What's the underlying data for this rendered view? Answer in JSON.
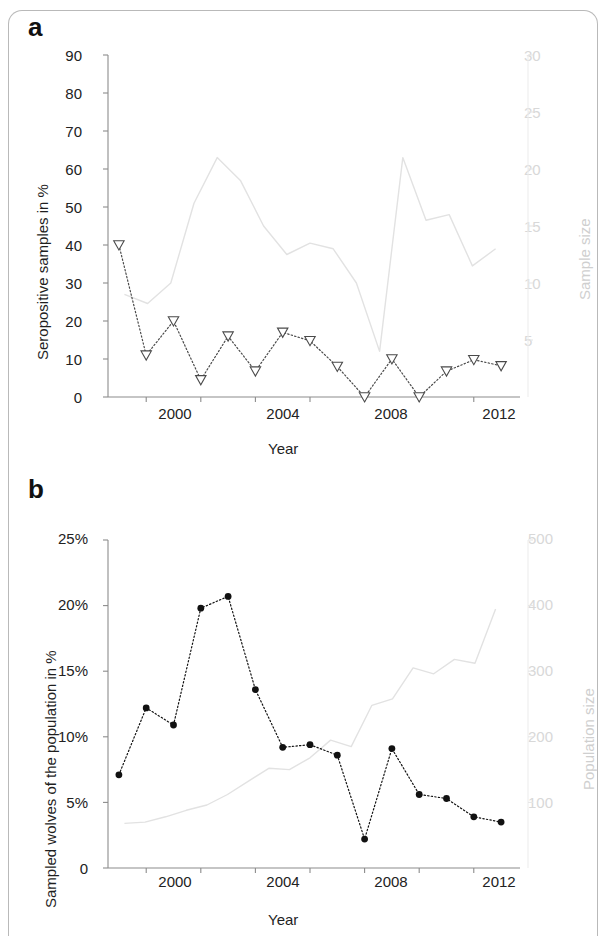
{
  "figure": {
    "panel_a_letter": "a",
    "panel_b_letter": "b"
  },
  "panel_a": {
    "ylabel_left": "Seropositive samples in %",
    "ylabel_right": "Sample size",
    "xlabel": "Year",
    "y_left_ticks": [
      "0",
      "10",
      "20",
      "30",
      "40",
      "50",
      "60",
      "70",
      "80",
      "90"
    ],
    "y_right_ticks": [
      "5",
      "10",
      "15",
      "20",
      "25",
      "30"
    ],
    "x_ticks": [
      "2000",
      "2004",
      "2008",
      "2012"
    ]
  },
  "panel_b": {
    "ylabel_left": "Sampled wolves of the population in %",
    "ylabel_right": "Population size",
    "xlabel": "Year",
    "y_left_ticks": [
      "0",
      "5%",
      "10%",
      "15%",
      "20%",
      "25%"
    ],
    "y_right_ticks": [
      "100",
      "200",
      "300",
      "400",
      "500"
    ],
    "x_ticks": [
      "2000",
      "2004",
      "2008",
      "2012"
    ]
  },
  "chart_data": [
    {
      "type": "line",
      "id": "panel-a",
      "title": "a",
      "xlabel": "Year",
      "ylabel": "Seropositive samples in %",
      "y2label": "Sample size",
      "xlim": [
        1998.6,
        2013.4
      ],
      "ylim": [
        0,
        90
      ],
      "y2lim": [
        0,
        30
      ],
      "grid": false,
      "legend": "none",
      "x": [
        1999,
        2000,
        2001,
        2002,
        2003,
        2004,
        2005,
        2006,
        2007,
        2008,
        2009,
        2010,
        2011,
        2012,
        2013
      ],
      "series": [
        {
          "name": "Seropositive samples in %",
          "axis": "left",
          "marker": "open-triangle-down",
          "linestyle": "dotted",
          "color": "#4a4a4a",
          "values": [
            40.0,
            11.0,
            20.0,
            4.5,
            16.0,
            6.8,
            17.0,
            14.8,
            8.0,
            0.0,
            10.0,
            0.0,
            6.8,
            9.8,
            8.2
          ]
        },
        {
          "name": "Sample size",
          "axis": "right",
          "marker": "none",
          "linestyle": "solid",
          "color": "#e2e2e2",
          "values": [
            9.0,
            8.2,
            10.0,
            17.0,
            21.0,
            19.0,
            15.0,
            12.5,
            13.5,
            13.0,
            10.0,
            4.0,
            21.0,
            15.5,
            16.0,
            11.5,
            13.0
          ]
        }
      ]
    },
    {
      "type": "line",
      "id": "panel-b",
      "title": "b",
      "xlabel": "Year",
      "ylabel": "Sampled wolves of the population in %",
      "y2label": "Population size",
      "xlim": [
        1998.6,
        2013.4
      ],
      "ylim": [
        0,
        25
      ],
      "y2lim": [
        0,
        500
      ],
      "grid": false,
      "legend": "none",
      "x": [
        1999,
        2000,
        2001,
        2002,
        2003,
        2004,
        2005,
        2006,
        2007,
        2008,
        2009,
        2010,
        2011,
        2012,
        2013
      ],
      "series": [
        {
          "name": "Sampled wolves of the population in %",
          "axis": "left",
          "marker": "filled-circle",
          "linestyle": "dotted",
          "color": "#111111",
          "values": [
            7.1,
            12.2,
            10.9,
            19.8,
            20.7,
            13.6,
            9.2,
            9.4,
            8.6,
            2.2,
            9.1,
            5.6,
            5.3,
            3.9,
            3.5
          ]
        },
        {
          "name": "Population size",
          "axis": "right",
          "marker": "none",
          "linestyle": "solid",
          "color": "#e2e2e2",
          "values": [
            68,
            70,
            78,
            88,
            96,
            112,
            132,
            152,
            150,
            168,
            195,
            185,
            248,
            258,
            305,
            296,
            318,
            312,
            395
          ]
        }
      ]
    }
  ]
}
